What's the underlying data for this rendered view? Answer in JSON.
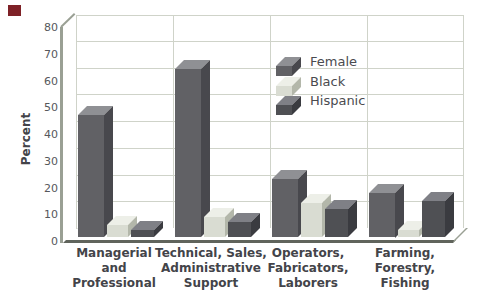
{
  "figure": {
    "kind": "3d-grouped-bar-chart",
    "background_color": "#ffffff",
    "decorations": {
      "corner_square_color": "#7e2127"
    }
  },
  "chart_data": {
    "type": "bar",
    "title": "",
    "xlabel": "",
    "ylabel": "Percent",
    "ylim": [
      0,
      80
    ],
    "yticks": [
      0,
      10,
      20,
      30,
      40,
      50,
      60,
      70,
      80
    ],
    "grid": true,
    "legend_position": "top-center-inside",
    "categories": [
      "Managerial and Professional",
      "Technical, Sales, Administrative Support",
      "Operators, Fabricators, Laborers",
      "Farming, Forestry, Fishing"
    ],
    "category_label_lines": [
      [
        "Managerial",
        "and",
        "Professional"
      ],
      [
        "Technical, Sales,",
        "Administrative",
        "Support"
      ],
      [
        "Operators,",
        "Fabricators,",
        "Laborers"
      ],
      [
        "Farming,",
        "Forestry,",
        "Fishing"
      ]
    ],
    "series": [
      {
        "name": "Female",
        "values": [
          49,
          66,
          25,
          20
        ],
        "color_front": "#616165",
        "color_top": "#8f9094",
        "color_side": "#48484d"
      },
      {
        "name": "Black",
        "values": [
          8,
          11,
          16,
          6
        ],
        "color_front": "#d9dcd2",
        "color_top": "#edefe8",
        "color_side": "#b3b7aa"
      },
      {
        "name": "Hispanic",
        "values": [
          6,
          9,
          14,
          17
        ],
        "color_front": "#4f5054",
        "color_top": "#7f8086",
        "color_side": "#3a3b40"
      }
    ],
    "style_colors": {
      "gridline": "#cfd3c9",
      "axis": "#9aa094",
      "floor_edge": "#60645c",
      "label_text": "#434449",
      "tick_text": "#56585c"
    }
  }
}
